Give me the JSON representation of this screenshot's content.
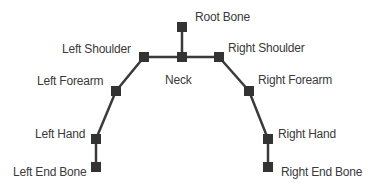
{
  "diagram": {
    "type": "bone-hierarchy",
    "colors": {
      "bone": "#3a3a3a",
      "joint": "#333333",
      "text": "#3a3a3a"
    },
    "nodes": [
      {
        "id": "root",
        "label": "Root Bone",
        "x": 182,
        "y": 27
      },
      {
        "id": "neck",
        "label": "Neck",
        "x": 182,
        "y": 57
      },
      {
        "id": "lshoulder",
        "label": "Left Shoulder",
        "x": 144,
        "y": 57
      },
      {
        "id": "rshoulder",
        "label": "Right Shoulder",
        "x": 219,
        "y": 57
      },
      {
        "id": "lforearm",
        "label": "Left Forearm",
        "x": 116,
        "y": 91
      },
      {
        "id": "rforearm",
        "label": "Right Forearm",
        "x": 249,
        "y": 91
      },
      {
        "id": "lhand",
        "label": "Left Hand",
        "x": 96,
        "y": 139
      },
      {
        "id": "rhand",
        "label": "Right Hand",
        "x": 268,
        "y": 139
      },
      {
        "id": "lend",
        "label": "Left End Bone",
        "x": 96,
        "y": 167
      },
      {
        "id": "rend",
        "label": "Right End Bone",
        "x": 268,
        "y": 167
      }
    ],
    "edges": [
      [
        "root",
        "neck"
      ],
      [
        "neck",
        "lshoulder"
      ],
      [
        "neck",
        "rshoulder"
      ],
      [
        "lshoulder",
        "lforearm"
      ],
      [
        "lforearm",
        "lhand"
      ],
      [
        "lhand",
        "lend"
      ],
      [
        "rshoulder",
        "rforearm"
      ],
      [
        "rforearm",
        "rhand"
      ],
      [
        "rhand",
        "rend"
      ]
    ]
  },
  "labels": {
    "root": "Root Bone",
    "neck": "Neck",
    "lshoulder": "Left Shoulder",
    "rshoulder": "Right Shoulder",
    "lforearm": "Left Forearm",
    "rforearm": "Right Forearm",
    "lhand": "Left Hand",
    "rhand": "Right Hand",
    "lend": "Left End Bone",
    "rend": "Right End Bone"
  }
}
